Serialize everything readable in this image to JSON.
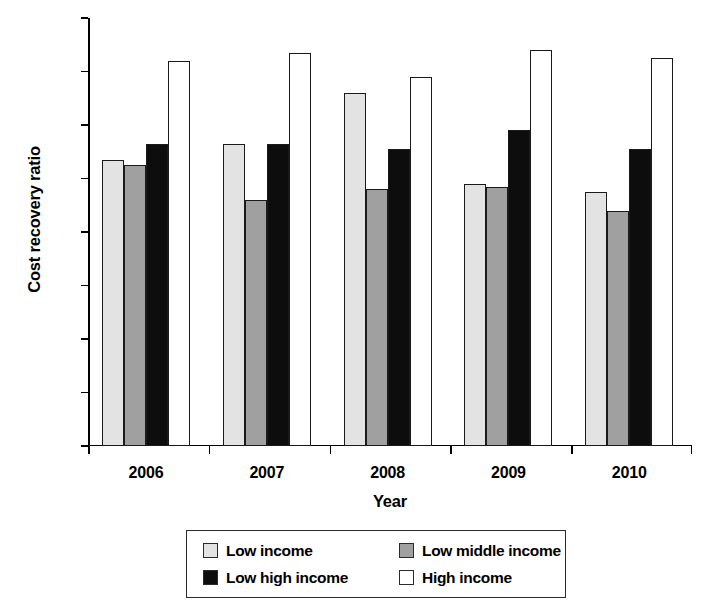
{
  "chart_data": {
    "type": "bar",
    "title": "",
    "xlabel": "Year",
    "ylabel": "Cost recovery ratio",
    "categories": [
      "2006",
      "2007",
      "2008",
      "2009",
      "2010"
    ],
    "series": [
      {
        "name": "Low income",
        "color": "#e3e3e3",
        "values": [
          1.07,
          1.13,
          1.32,
          0.98,
          0.95
        ]
      },
      {
        "name": "Low middle income",
        "color": "#a0a0a0",
        "values": [
          1.05,
          0.92,
          0.96,
          0.97,
          0.88
        ]
      },
      {
        "name": "Low high income",
        "color": "#0d0d0d",
        "values": [
          1.13,
          1.13,
          1.11,
          1.18,
          1.11
        ]
      },
      {
        "name": "High income",
        "color": "#ffffff",
        "values": [
          1.44,
          1.47,
          1.38,
          1.48,
          1.45
        ]
      }
    ],
    "ylim": [
      0,
      1.6
    ],
    "ytick_labels": [
      "0",
      "0.2",
      "0.4",
      "0.6",
      "0.8",
      "1.0",
      "1.2",
      "1.4",
      "1.6"
    ],
    "ytick_values": [
      0,
      0.2,
      0.4,
      0.6,
      0.8,
      1.0,
      1.2,
      1.4,
      1.6
    ],
    "grid": false,
    "legend_position": "bottom-center"
  }
}
